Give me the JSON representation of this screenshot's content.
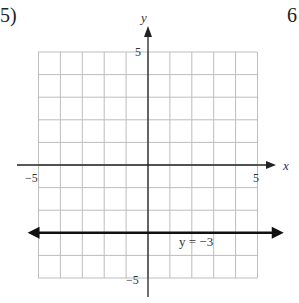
{
  "problem": {
    "number": "5)",
    "next_number_partial": "6"
  },
  "chart_data": {
    "type": "line",
    "title": "",
    "xlabel": "x",
    "ylabel": "y",
    "xlim": [
      -5,
      5
    ],
    "ylim": [
      -5,
      5
    ],
    "grid": true,
    "grid_step": 1,
    "x_tick_labels": [
      {
        "value": -5,
        "label": "−5"
      },
      {
        "value": 5,
        "label": "5"
      }
    ],
    "y_tick_labels": [
      {
        "value": 5,
        "label": "5"
      },
      {
        "value": -5,
        "label": "−5"
      }
    ],
    "series": [
      {
        "name": "y = −3",
        "equation": "y = −3",
        "type": "horizontal-line",
        "y": -3,
        "x": [
          -5.5,
          6.2
        ],
        "values": [
          -3,
          -3
        ],
        "arrows": "both"
      }
    ],
    "annotations": [
      {
        "text": "y = −3",
        "x": 1.6,
        "y": -3.4
      }
    ]
  },
  "colors": {
    "grid": "#bdbdbd",
    "axis": "#222222",
    "line": "#111111",
    "background": "#ffffff"
  }
}
